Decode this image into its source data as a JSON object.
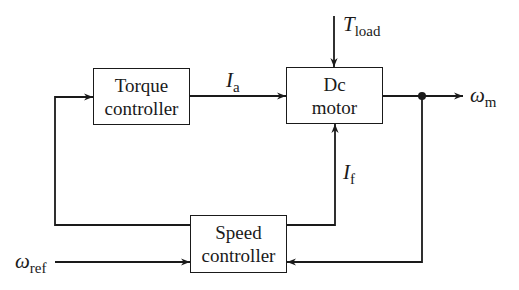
{
  "diagram": {
    "type": "block-diagram",
    "blocks": {
      "torque": {
        "line1": "Torque",
        "line2": "controller"
      },
      "motor": {
        "line1": "Dc",
        "line2": "motor"
      },
      "speed": {
        "line1": "Speed",
        "line2": "controller"
      }
    },
    "signals": {
      "ia": {
        "main": "I",
        "sub": "a"
      },
      "if": {
        "main": "I",
        "sub": "f"
      },
      "tload": {
        "main": "T",
        "sub": "load"
      },
      "wm": {
        "main": "ω",
        "sub": "m"
      },
      "wref": {
        "main": "ω",
        "sub": "ref"
      }
    },
    "edges": [
      "Torque controller → Dc motor (Ia)",
      "T_load → Dc motor",
      "Dc motor → ω_m",
      "ω_m feedback → Speed controller",
      "ω_ref → Speed controller",
      "Speed controller → Torque controller",
      "Speed controller → Dc motor (If)"
    ]
  }
}
